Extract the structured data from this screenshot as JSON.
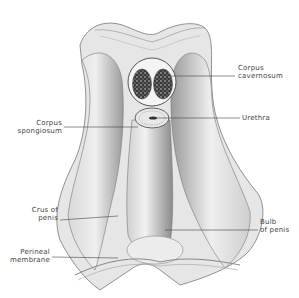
{
  "diagram": {
    "title": "",
    "labels": [
      {
        "id": "corpus-cavernosum",
        "lines": [
          "Corpus",
          "cavernosum"
        ],
        "side": "right"
      },
      {
        "id": "urethra",
        "lines": [
          "Urethra"
        ],
        "side": "right"
      },
      {
        "id": "corpus-spongiosum",
        "lines": [
          "Corpus",
          "spongiosum"
        ],
        "side": "left"
      },
      {
        "id": "crus-of-penis",
        "lines": [
          "Crus of",
          "penis"
        ],
        "side": "left"
      },
      {
        "id": "bulb-of-penis",
        "lines": [
          "Bulb",
          "of penis"
        ],
        "side": "right"
      },
      {
        "id": "perineal-membrane",
        "lines": [
          "Perineal",
          "membrane"
        ],
        "side": "left"
      }
    ],
    "colors": {
      "background": "#ffffff",
      "ink": "#444444",
      "tissue_light": "#e4e4e4",
      "tissue_mid": "#bdbdbd",
      "tissue_dark": "#6e6e6e",
      "spongy": "#3a3a3a"
    }
  }
}
